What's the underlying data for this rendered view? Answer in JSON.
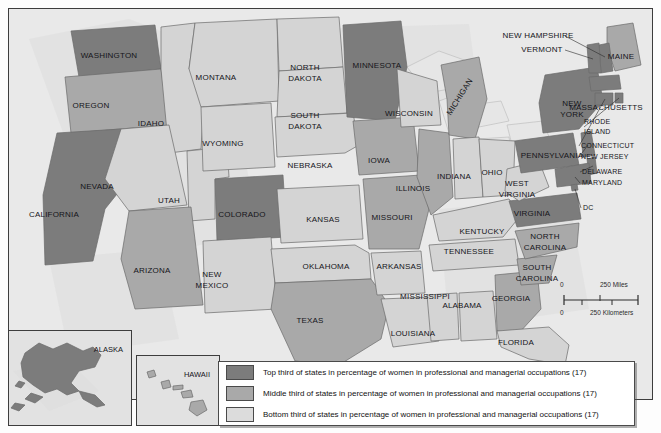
{
  "map": {
    "title": "Women in professional and managerial occupations by state",
    "colors": {
      "top_third": "#7c7c7c",
      "middle_third": "#a9a9a9",
      "bottom_third": "#d4d4d4",
      "border": "#6a6a6a",
      "water": "#e6e6e6",
      "frame": "#3d3d3d"
    },
    "states": [
      {
        "name": "WASHINGTON",
        "tone": "top",
        "x": 100,
        "y": 47,
        "label": true
      },
      {
        "name": "OREGON",
        "tone": "mid",
        "x": 82,
        "y": 97,
        "label": true
      },
      {
        "name": "CALIFORNIA",
        "tone": "top",
        "x": 45,
        "y": 206,
        "label": true
      },
      {
        "name": "IDAHO",
        "tone": "bot",
        "x": 142,
        "y": 115,
        "label": true
      },
      {
        "name": "NEVADA",
        "tone": "bot",
        "x": 88,
        "y": 178,
        "label": true
      },
      {
        "name": "UTAH",
        "tone": "bot",
        "x": 160,
        "y": 192,
        "label": true
      },
      {
        "name": "ARIZONA",
        "tone": "mid",
        "x": 143,
        "y": 262,
        "label": true
      },
      {
        "name": "MONTANA",
        "tone": "bot",
        "x": 207,
        "y": 69,
        "label": true
      },
      {
        "name": "WYOMING",
        "tone": "bot",
        "x": 214,
        "y": 135,
        "label": true
      },
      {
        "name": "COLORADO",
        "tone": "top",
        "x": 233,
        "y": 206,
        "label": true
      },
      {
        "name": "NEW MEXICO",
        "tone": "bot",
        "x": 203,
        "y": 271,
        "label": true
      },
      {
        "name": "NORTH DAKOTA",
        "tone": "bot",
        "x": 296,
        "y": 65,
        "label": true
      },
      {
        "name": "SOUTH DAKOTA",
        "tone": "bot",
        "x": 296,
        "y": 113,
        "label": true
      },
      {
        "name": "NEBRASKA",
        "tone": "bot",
        "x": 301,
        "y": 157,
        "label": true
      },
      {
        "name": "KANSAS",
        "tone": "bot",
        "x": 314,
        "y": 211,
        "label": true
      },
      {
        "name": "OKLAHOMA",
        "tone": "bot",
        "x": 317,
        "y": 258,
        "label": true
      },
      {
        "name": "TEXAS",
        "tone": "mid",
        "x": 301,
        "y": 312,
        "label": true
      },
      {
        "name": "MINNESOTA",
        "tone": "top",
        "x": 368,
        "y": 57,
        "label": true
      },
      {
        "name": "IOWA",
        "tone": "mid",
        "x": 370,
        "y": 152,
        "label": true
      },
      {
        "name": "MISSOURI",
        "tone": "mid",
        "x": 383,
        "y": 209,
        "label": true
      },
      {
        "name": "ARKANSAS",
        "tone": "bot",
        "x": 390,
        "y": 258,
        "label": true
      },
      {
        "name": "LOUISIANA",
        "tone": "bot",
        "x": 404,
        "y": 325,
        "label": true
      },
      {
        "name": "WISCONSIN",
        "tone": "bot",
        "x": 400,
        "y": 105,
        "label": true
      },
      {
        "name": "ILLINOIS",
        "tone": "mid",
        "x": 404,
        "y": 180,
        "label": true
      },
      {
        "name": "MISSISSIPPI",
        "tone": "bot",
        "x": 416,
        "y": 288,
        "label": true
      },
      {
        "name": "MICHIGAN",
        "tone": "mid",
        "x": 451,
        "y": 88,
        "label": true
      },
      {
        "name": "INDIANA",
        "tone": "bot",
        "x": 445,
        "y": 168,
        "label": true
      },
      {
        "name": "OHIO",
        "tone": "bot",
        "x": 483,
        "y": 164,
        "label": true
      },
      {
        "name": "KENTUCKY",
        "tone": "bot",
        "x": 473,
        "y": 223,
        "label": true
      },
      {
        "name": "TENNESSEE",
        "tone": "bot",
        "x": 460,
        "y": 243,
        "label": true
      },
      {
        "name": "ALABAMA",
        "tone": "bot",
        "x": 453,
        "y": 297,
        "label": true
      },
      {
        "name": "GEORGIA",
        "tone": "mid",
        "x": 502,
        "y": 290,
        "label": true
      },
      {
        "name": "FLORIDA",
        "tone": "bot",
        "x": 507,
        "y": 334,
        "label": true
      },
      {
        "name": "SOUTH CAROLINA",
        "tone": "mid",
        "x": 528,
        "y": 264,
        "label": true
      },
      {
        "name": "NORTH CAROLINA",
        "tone": "mid",
        "x": 536,
        "y": 233,
        "label": true
      },
      {
        "name": "VIRGINIA",
        "tone": "top",
        "x": 523,
        "y": 205,
        "label": true
      },
      {
        "name": "WEST VIRGINIA",
        "tone": "bot",
        "x": 508,
        "y": 180,
        "label": true
      },
      {
        "name": "PENNSYLVANIA",
        "tone": "top",
        "x": 543,
        "y": 147,
        "label": true
      },
      {
        "name": "NEW YORK",
        "tone": "top",
        "x": 563,
        "y": 100,
        "label": true
      },
      {
        "name": "MAINE",
        "tone": "mid",
        "x": 612,
        "y": 48,
        "label": true
      },
      {
        "name": "NEW HAMPSHIRE",
        "tone": "top",
        "x": 529,
        "y": 27,
        "label": true
      },
      {
        "name": "VERMONT",
        "tone": "top",
        "x": 533,
        "y": 41,
        "label": true
      },
      {
        "name": "MASSACHUSETTS",
        "tone": "top",
        "x": 597,
        "y": 99,
        "label": true
      },
      {
        "name": "RHODE ISLAND",
        "tone": "top",
        "x": 598,
        "y": 118,
        "label": true
      },
      {
        "name": "CONNECTICUT",
        "tone": "top",
        "x": 598,
        "y": 137,
        "label": true
      },
      {
        "name": "NEW JERSEY",
        "tone": "top",
        "x": 597,
        "y": 148,
        "label": true
      },
      {
        "name": "DELAWARE",
        "tone": "top",
        "x": 598,
        "y": 163,
        "label": true
      },
      {
        "name": "MARYLAND",
        "tone": "top",
        "x": 598,
        "y": 174,
        "label": true
      },
      {
        "name": "DC",
        "tone": "top",
        "x": 597,
        "y": 199,
        "label": true
      },
      {
        "name": "ALASKA",
        "tone": "top",
        "x": 0,
        "y": 0,
        "label": false
      },
      {
        "name": "HAWAII",
        "tone": "mid",
        "x": 0,
        "y": 0,
        "label": false
      }
    ]
  },
  "insets": {
    "alaska": {
      "label": "ALASKA",
      "tone": "top"
    },
    "hawaii": {
      "label": "HAWAII",
      "tone": "mid"
    }
  },
  "scalebar": {
    "miles_zero": "0",
    "miles_value": "250 Miles",
    "km_zero": "0",
    "km_value": "250 Kilometers"
  },
  "legend": {
    "rows": [
      {
        "tone": "top",
        "text": "Top third of states in percentage of women in professional and managerial occupations (17)"
      },
      {
        "tone": "mid",
        "text": "Middle third of states in percentage of women in professional and managerial occupations (17)"
      },
      {
        "tone": "bot",
        "text": "Bottom third of states in percentage of women in professional and managerial occupations (17)"
      }
    ]
  }
}
